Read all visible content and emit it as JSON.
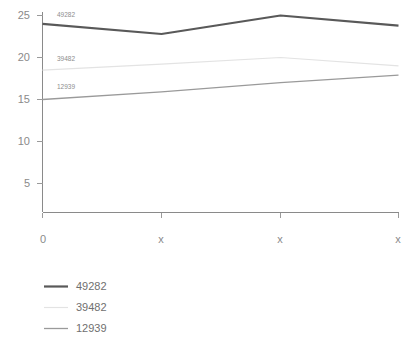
{
  "chart_data": {
    "type": "line",
    "title": "",
    "subtitle": "",
    "xlabel": "",
    "ylabel": "",
    "x": [
      "0",
      "x",
      "x",
      "x"
    ],
    "categories": [
      "0",
      "x",
      "x",
      "x"
    ],
    "xtick_labels": [
      "0",
      "x",
      "x",
      "x"
    ],
    "ytick_labels": [
      "5",
      "10",
      "15",
      "20",
      "25"
    ],
    "ytick_values": [
      5,
      10,
      15,
      20,
      25
    ],
    "ylim": [
      0,
      25
    ],
    "xlim": [
      0,
      3
    ],
    "grid": false,
    "legend_position": "bottom-left",
    "series": [
      {
        "name": "49282",
        "color": "#595959",
        "line_width": 2.2,
        "inline_label": "49282",
        "values": [
          24.0,
          22.8,
          25.0,
          23.8
        ]
      },
      {
        "name": "39482",
        "color": "#e3e3e3",
        "line_width": 1.2,
        "inline_label": "39482",
        "values": [
          18.5,
          19.2,
          20.0,
          19.0
        ]
      },
      {
        "name": "12939",
        "color": "#9a9a9a",
        "line_width": 1.3,
        "inline_label": "12939",
        "values": [
          15.0,
          15.9,
          17.0,
          17.9
        ]
      }
    ],
    "annotations": [
      {
        "text": "49282",
        "series": "49282",
        "x_index": 0
      },
      {
        "text": "39482",
        "series": "39482",
        "x_index": 0
      },
      {
        "text": "12939",
        "series": "12939",
        "x_index": 0
      }
    ]
  },
  "legend": {
    "items": [
      {
        "label": "49282",
        "color": "#595959",
        "line_width": 2.2
      },
      {
        "label": "39482",
        "color": "#e3e3e3",
        "line_width": 1.2
      },
      {
        "label": "12939",
        "color": "#9a9a9a",
        "line_width": 1.3
      }
    ]
  },
  "axis": {
    "y_labels": [
      "25",
      "20",
      "15",
      "10",
      "5"
    ],
    "x_labels": [
      "0",
      "x",
      "x",
      "x"
    ],
    "axis_color": "#8a8a8a"
  }
}
